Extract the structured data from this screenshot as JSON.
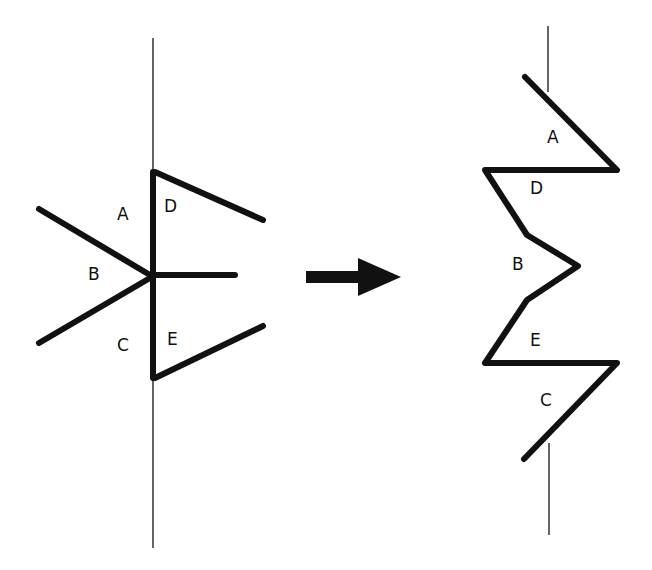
{
  "diagram": {
    "left_figure": {
      "labels": {
        "A": "A",
        "B": "B",
        "C": "C",
        "D": "D",
        "E": "E"
      }
    },
    "arrow": {
      "direction": "right",
      "color": "#111111"
    },
    "right_figure": {
      "labels": {
        "A": "A",
        "D": "D",
        "B": "B",
        "E": "E",
        "C": "C"
      }
    }
  }
}
